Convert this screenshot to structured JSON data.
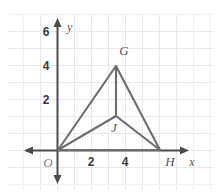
{
  "figure": {
    "background_color": "#ffffff",
    "grid_color": "#e8e8ea",
    "axis_color": "#4a4a4f",
    "segment_color": "#6d6d72",
    "label_color": "#3c3c41"
  },
  "axes": {
    "x_axis_name": "x",
    "y_axis_name": "y",
    "origin_label": "O",
    "x_ticks": [
      {
        "value": 2,
        "label": "2"
      },
      {
        "value": 4,
        "label": "4"
      }
    ],
    "y_ticks": [
      {
        "value": 2,
        "label": "2"
      },
      {
        "value": 4,
        "label": "4"
      },
      {
        "value": 6,
        "label": "6"
      }
    ],
    "x_range": [
      -1,
      7.5
    ],
    "y_range": [
      -1.5,
      7
    ],
    "grid": true,
    "grid_step": 1
  },
  "points": [
    {
      "name": "O",
      "label": "O",
      "x": 0,
      "y": 0
    },
    {
      "name": "G",
      "label": "G",
      "x": 3.5,
      "y": 5
    },
    {
      "name": "H",
      "label": "H",
      "x": 6,
      "y": 0
    },
    {
      "name": "J",
      "label": "J",
      "x": 3.5,
      "y": 2
    }
  ],
  "segments": [
    {
      "name": "segment-OG",
      "from": "O",
      "to": "G"
    },
    {
      "name": "segment-GH",
      "from": "G",
      "to": "H"
    },
    {
      "name": "segment-OH",
      "from": "O",
      "to": "H"
    },
    {
      "name": "segment-OJ",
      "from": "O",
      "to": "J"
    },
    {
      "name": "segment-JH",
      "from": "J",
      "to": "H"
    },
    {
      "name": "segment-JG",
      "from": "J",
      "to": "G"
    }
  ],
  "labels": {
    "tick_x_2": "2",
    "tick_x_4": "4",
    "tick_y_2": "2",
    "tick_y_4": "4",
    "tick_y_6": "6",
    "point_G": "G",
    "point_H": "H",
    "point_J": "J",
    "origin": "O",
    "axis_x": "x",
    "axis_y": "y"
  }
}
